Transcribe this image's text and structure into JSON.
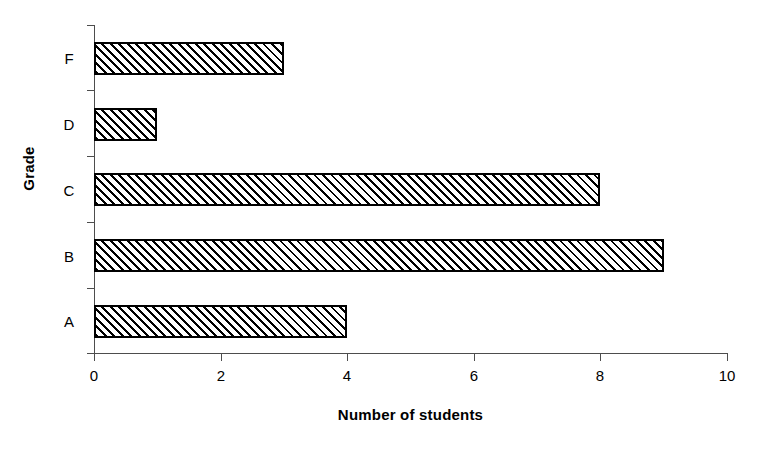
{
  "chart_data": {
    "type": "bar",
    "orientation": "horizontal",
    "title": "",
    "xlabel": "Number of students",
    "ylabel": "Grade",
    "categories": [
      "A",
      "B",
      "C",
      "D",
      "F"
    ],
    "values": [
      4,
      9,
      8,
      1,
      3
    ],
    "xlim": [
      0,
      10
    ],
    "xticks": [
      0,
      2,
      4,
      6,
      8,
      10
    ],
    "xtick_labels": [
      "0",
      "2",
      "4",
      "6",
      "8",
      "10"
    ],
    "grid": false,
    "legend": null,
    "bar_style": {
      "fill": "diagonal-hatch",
      "hatch_color": "#000000",
      "background": "#ffffff",
      "border_color": "#000000"
    },
    "axis_color": "#4d4d4d",
    "points": [
      {
        "category": "A",
        "value": 4
      },
      {
        "category": "B",
        "value": 9
      },
      {
        "category": "C",
        "value": 8
      },
      {
        "category": "D",
        "value": 1
      },
      {
        "category": "F",
        "value": 3
      }
    ]
  }
}
